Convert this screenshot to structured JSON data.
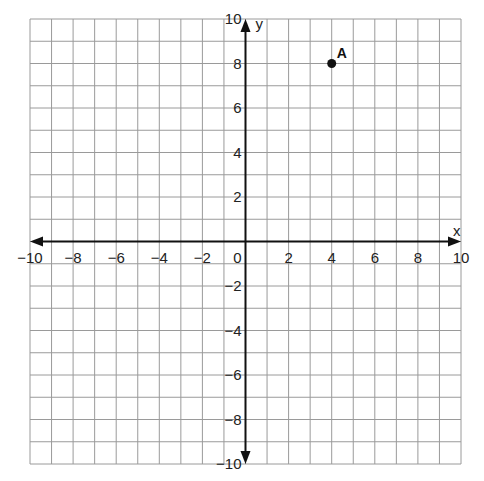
{
  "chart_data": {
    "type": "scatter",
    "title": "",
    "xlabel": "x",
    "ylabel": "y",
    "xlim": [
      -10,
      10
    ],
    "ylim": [
      -10,
      10
    ],
    "grid": true,
    "grid_step": 1,
    "x_ticks": [
      -10,
      -8,
      -6,
      -4,
      -2,
      0,
      2,
      4,
      6,
      8,
      10
    ],
    "y_ticks": [
      -10,
      -8,
      -6,
      -4,
      -2,
      2,
      4,
      6,
      8,
      10
    ],
    "tick_labels": {
      "x": [
        "−10",
        "−8",
        "−6",
        "−4",
        "−2",
        "0",
        "2",
        "4",
        "6",
        "8",
        "10"
      ],
      "y": [
        "−10",
        "−8",
        "−6",
        "−4",
        "−2",
        "2",
        "4",
        "6",
        "8",
        "10"
      ]
    },
    "points": [
      {
        "label": "A",
        "x": 4,
        "y": 8
      }
    ],
    "colors": {
      "grid": "#9a9a9a",
      "axis": "#111111",
      "point": "#111111"
    }
  }
}
